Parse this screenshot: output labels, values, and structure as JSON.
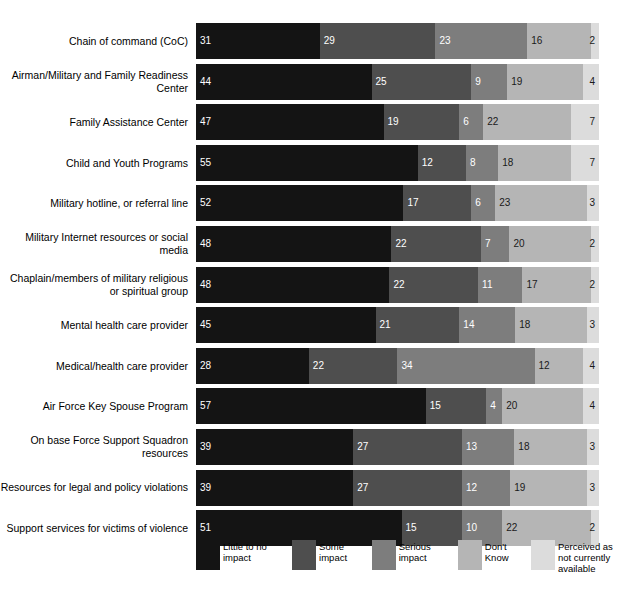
{
  "chart_data": {
    "type": "bar",
    "orientation": "horizontal",
    "stacked": true,
    "stack_mode": "percent",
    "title": "",
    "subtitle": "",
    "xlabel": "",
    "ylabel": "",
    "xlim": [
      0,
      100
    ],
    "grid": false,
    "legend_position": "bottom",
    "value_labels_shown": true,
    "categories": [
      "Chain of command (CoC)",
      "Airman/Military and Family Readiness Center",
      "Family Assistance Center",
      "Child and Youth Programs",
      "Military hotline, or referral line",
      "Military Internet resources or social media",
      "Chaplain/members of military religious or spiritual group",
      "Mental health care provider",
      "Medical/health care provider",
      "Air Force Key Spouse Program",
      "On base Force Support Squadron resources",
      "Resources for legal and policy violations",
      "Support services for victims of violence"
    ],
    "series": [
      {
        "name": "Little to no impact",
        "color": "#141414",
        "values": [
          31,
          44,
          47,
          55,
          52,
          48,
          48,
          45,
          28,
          57,
          39,
          39,
          51
        ]
      },
      {
        "name": "Some impact",
        "color": "#4e4e4e",
        "values": [
          29,
          25,
          19,
          12,
          17,
          22,
          22,
          21,
          22,
          15,
          27,
          27,
          15
        ]
      },
      {
        "name": "Serious impact",
        "color": "#7d7d7d",
        "values": [
          23,
          9,
          6,
          8,
          6,
          7,
          11,
          14,
          34,
          4,
          13,
          12,
          10
        ]
      },
      {
        "name": "Don't Know",
        "color": "#b5b5b5",
        "values": [
          16,
          19,
          22,
          18,
          23,
          20,
          17,
          18,
          12,
          20,
          18,
          19,
          22
        ]
      },
      {
        "name": "Perceived as not currently available",
        "color": "#dcdcdc",
        "values": [
          2,
          4,
          7,
          7,
          3,
          2,
          2,
          3,
          4,
          4,
          3,
          3,
          2
        ]
      }
    ],
    "legend": [
      {
        "label": "Little to no impact",
        "color": "#141414"
      },
      {
        "label": "Some impact",
        "color": "#4e4e4e"
      },
      {
        "label": "Serious impact",
        "color": "#7d7d7d"
      },
      {
        "label": "Don't Know",
        "color": "#b5b5b5"
      },
      {
        "label": "Perceived as not currently available",
        "color": "#dcdcdc"
      }
    ]
  }
}
